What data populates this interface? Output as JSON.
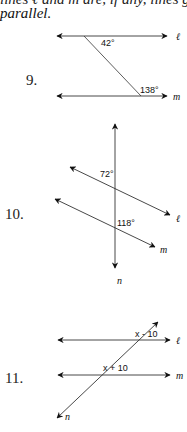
{
  "header": {
    "line1": "lines ℓ and m are, if any, lines g, h are",
    "line2": "parallel."
  },
  "problems": [
    {
      "number": "9.",
      "lines": {
        "top": "ℓ",
        "bottom": "m"
      },
      "angles": [
        "42°",
        "138°"
      ]
    },
    {
      "number": "10.",
      "lines": {
        "top": "ℓ",
        "bottom": "m",
        "transversal": "n"
      },
      "angles": [
        "72°",
        "118°"
      ]
    },
    {
      "number": "11.",
      "lines": {
        "top": "ℓ",
        "bottom": "m",
        "transversal": "n"
      },
      "angles": [
        "x - 10",
        "x + 10"
      ]
    }
  ]
}
